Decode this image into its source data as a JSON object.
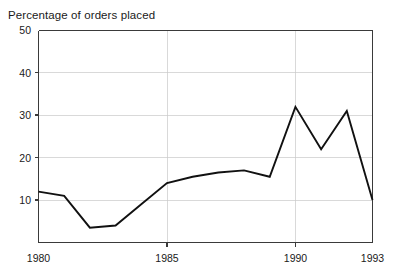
{
  "chart_data": {
    "type": "line",
    "title": "Percentage of orders placed",
    "subtitle": "",
    "xlabel": "",
    "ylabel": "",
    "x": [
      1980,
      1981,
      1982,
      1983,
      1984,
      1985,
      1986,
      1987,
      1988,
      1989,
      1990,
      1991,
      1992,
      1993
    ],
    "values": [
      12,
      11,
      3.5,
      4,
      9,
      14,
      15.5,
      16.5,
      17,
      15.5,
      32,
      22,
      31,
      10
    ],
    "series": [
      {
        "name": "Percentage of orders placed",
        "color": "#111111",
        "values": [
          12,
          11,
          3.5,
          4,
          9,
          14,
          15.5,
          16.5,
          17,
          15.5,
          32,
          22,
          31,
          10
        ]
      }
    ],
    "xlim": [
      1980,
      1993
    ],
    "ylim": [
      0,
      50
    ],
    "x_ticks": [
      1980,
      1985,
      1990,
      1993
    ],
    "x_tick_labels": [
      "1980",
      "1985",
      "1990",
      "1993"
    ],
    "y_ticks": [
      10,
      20,
      30,
      40,
      50
    ],
    "y_tick_labels": [
      "10",
      "20",
      "30",
      "40",
      "50"
    ],
    "grid": true,
    "grid_axis": "both",
    "grid_color": "#c9c9c9",
    "legend": false,
    "legend_position": "none",
    "annotations": [],
    "axis_color": "#3a3a3a",
    "background_color": "#ffffff"
  },
  "axes": {
    "y_labels": [
      {
        "value": "50"
      },
      {
        "value": "40"
      },
      {
        "value": "30"
      },
      {
        "value": "20"
      },
      {
        "value": "10"
      }
    ],
    "x_labels": [
      {
        "value": "1980"
      },
      {
        "value": "1985"
      },
      {
        "value": "1990"
      },
      {
        "value": "1993"
      }
    ]
  }
}
